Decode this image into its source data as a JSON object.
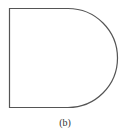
{
  "figure": {
    "shape": "D-shape (rectangle with semicircular right end)",
    "stroke_color": "#555555",
    "fill_color": "#ffffff",
    "geometry": {
      "left": 9,
      "top": 8,
      "bottom": 108,
      "straight_top_end_x": 70,
      "arc_radius": 50
    }
  },
  "caption": {
    "label": "(b)"
  }
}
